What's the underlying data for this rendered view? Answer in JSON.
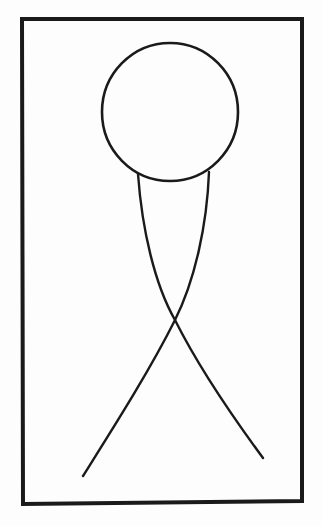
{
  "figure": {
    "colors": {
      "background": "#fdfdfd",
      "stroke": "#1a1a1a"
    },
    "frame": {
      "x": 22,
      "y": 19,
      "width": 281,
      "height": 484,
      "stroke_width": 4
    },
    "head": {
      "cx": 170,
      "cy": 112,
      "rx": 68,
      "ry": 69,
      "stroke_width": 2.5
    },
    "legs": [
      {
        "name": "left-to-right-leg",
        "start": [
          138,
          174
        ],
        "cross": [
          175,
          320
        ],
        "end": [
          263,
          458
        ]
      },
      {
        "name": "right-to-left-leg",
        "start": [
          209,
          172
        ],
        "cross": [
          175,
          320
        ],
        "end": [
          83,
          476
        ]
      }
    ]
  }
}
